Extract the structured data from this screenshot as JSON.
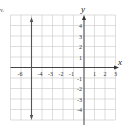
{
  "problem": {
    "label": "v."
  },
  "axes": {
    "x_label": "x",
    "y_label": "y",
    "x_range": [
      -7,
      3
    ],
    "y_range": [
      -5,
      5
    ]
  },
  "x_tick_labels": [
    "-6",
    "-4",
    "-3",
    "-2",
    "-1",
    "1",
    "2",
    "3"
  ],
  "y_tick_labels": [
    "4",
    "3",
    "2",
    "1",
    "-1",
    "-2",
    "-3",
    "-4"
  ],
  "graphed_line": {
    "equation": "x = -5",
    "type": "vertical",
    "x": -5
  },
  "colors": {
    "grid": "#c8c8c8",
    "axis": "#333333",
    "line": "#555555"
  }
}
